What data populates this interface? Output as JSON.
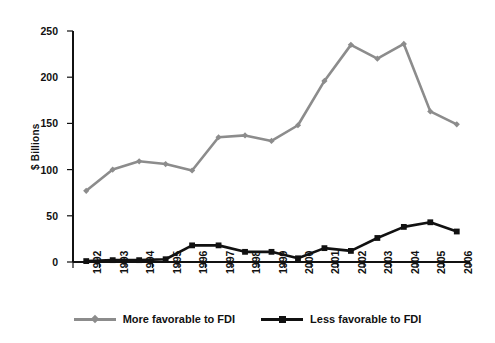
{
  "chart_data": {
    "type": "line",
    "title": "",
    "xlabel": "",
    "ylabel": "$ Billions",
    "ylim": [
      0,
      250
    ],
    "yticks": [
      0,
      50,
      100,
      150,
      200,
      250
    ],
    "grid": false,
    "legend_position": "bottom",
    "categories": [
      "1992",
      "1993",
      "1994",
      "1995",
      "1996",
      "1997",
      "1998",
      "1999",
      "2000",
      "2001",
      "2002",
      "2003",
      "2004",
      "2005",
      "2006"
    ],
    "series": [
      {
        "name": "More favorable to FDI",
        "color": "#8c8c8c",
        "marker": "diamond",
        "values": [
          77,
          100,
          109,
          106,
          99,
          135,
          137,
          131,
          148,
          196,
          235,
          220,
          236,
          163,
          149
        ]
      },
      {
        "name": "Less favorable to FDI",
        "color": "#111111",
        "marker": "square",
        "values": [
          1,
          2,
          2,
          3,
          18,
          18,
          11,
          11,
          4,
          15,
          12,
          26,
          38,
          43,
          33
        ]
      }
    ]
  },
  "legend": {
    "entries": [
      {
        "label": "More favorable to FDI"
      },
      {
        "label": "Less favorable to FDI"
      }
    ]
  },
  "axis": {
    "y_title": "$ Billions"
  }
}
